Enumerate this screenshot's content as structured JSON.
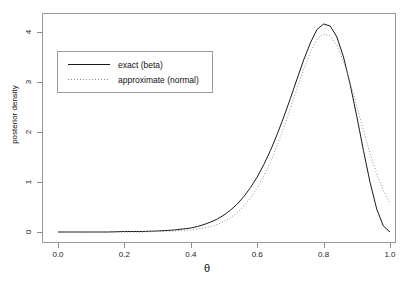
{
  "chart_data": {
    "type": "line",
    "title": "",
    "xlabel": "θ",
    "ylabel": "posterior density",
    "xlim": [
      0.0,
      1.0
    ],
    "ylim": [
      0.0,
      4.3
    ],
    "xticks": [
      "0.0",
      "0.2",
      "0.4",
      "0.6",
      "0.8",
      "1.0"
    ],
    "xtick_values": [
      0.0,
      0.2,
      0.4,
      0.6,
      0.8,
      1.0
    ],
    "yticks": [
      "0",
      "1",
      "2",
      "3",
      "4"
    ],
    "ytick_values": [
      0,
      1,
      2,
      3,
      4
    ],
    "grid": false,
    "legend_position": "upper left",
    "series": [
      {
        "name": "exact (beta)",
        "style": "solid",
        "color": "#1a1a1a",
        "peak_x": 0.79,
        "peak_y": 4.15,
        "x": [
          0.0,
          0.05,
          0.1,
          0.15,
          0.2,
          0.25,
          0.3,
          0.35,
          0.4,
          0.42,
          0.44,
          0.46,
          0.48,
          0.5,
          0.52,
          0.54,
          0.56,
          0.58,
          0.6,
          0.62,
          0.64,
          0.66,
          0.68,
          0.7,
          0.72,
          0.74,
          0.76,
          0.78,
          0.8,
          0.82,
          0.84,
          0.86,
          0.88,
          0.9,
          0.92,
          0.94,
          0.96,
          0.98,
          1.0
        ],
        "y": [
          0.0,
          0.0,
          0.0,
          0.0,
          0.01,
          0.01,
          0.02,
          0.04,
          0.08,
          0.11,
          0.15,
          0.2,
          0.26,
          0.34,
          0.44,
          0.56,
          0.71,
          0.89,
          1.1,
          1.35,
          1.63,
          1.95,
          2.3,
          2.67,
          3.06,
          3.44,
          3.78,
          4.05,
          4.16,
          4.12,
          3.9,
          3.5,
          2.95,
          2.31,
          1.63,
          0.99,
          0.46,
          0.12,
          0.0
        ]
      },
      {
        "name": "approximate (normal)",
        "style": "dotted",
        "color": "#8f8f8f",
        "peak_x": 0.8,
        "peak_y": 3.95,
        "x": [
          0.0,
          0.05,
          0.1,
          0.15,
          0.2,
          0.25,
          0.3,
          0.35,
          0.4,
          0.42,
          0.44,
          0.46,
          0.48,
          0.5,
          0.52,
          0.54,
          0.56,
          0.58,
          0.6,
          0.62,
          0.64,
          0.66,
          0.68,
          0.7,
          0.72,
          0.74,
          0.76,
          0.78,
          0.8,
          0.82,
          0.84,
          0.86,
          0.88,
          0.9,
          0.92,
          0.94,
          0.96,
          0.98,
          1.0
        ],
        "y": [
          0.0,
          0.0,
          0.0,
          0.0,
          0.0,
          0.0,
          0.01,
          0.02,
          0.04,
          0.06,
          0.08,
          0.11,
          0.15,
          0.21,
          0.29,
          0.39,
          0.52,
          0.68,
          0.88,
          1.12,
          1.4,
          1.73,
          2.09,
          2.47,
          2.87,
          3.25,
          3.59,
          3.85,
          3.96,
          3.92,
          3.73,
          3.41,
          2.99,
          2.52,
          2.03,
          1.57,
          1.16,
          0.83,
          0.57
        ]
      }
    ]
  }
}
